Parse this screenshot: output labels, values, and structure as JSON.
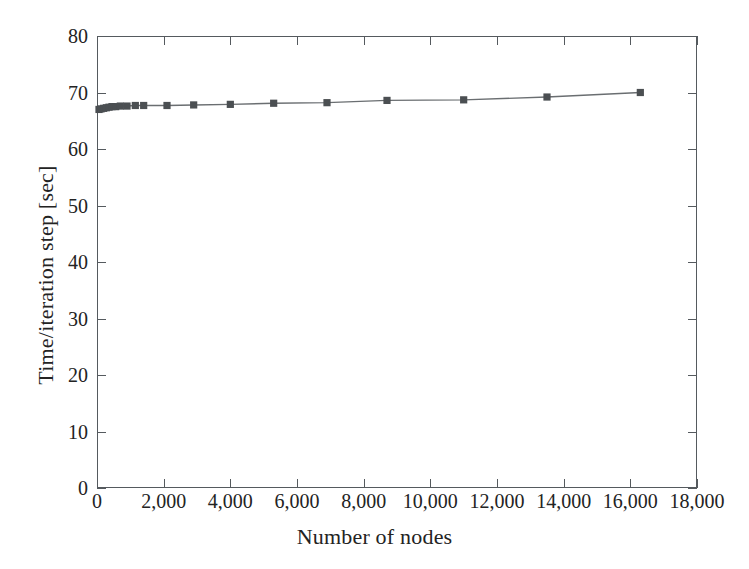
{
  "chart_data": {
    "type": "line",
    "title": "",
    "xlabel": "Number of nodes",
    "ylabel": "Time/iteration step [sec]",
    "xlim": [
      0,
      18000
    ],
    "ylim": [
      0,
      80
    ],
    "grid": false,
    "legend": "none",
    "marker": "square",
    "series_color": "#4b4f52",
    "line_color": "#6a6e71",
    "xticks": [
      0,
      2000,
      4000,
      6000,
      8000,
      10000,
      12000,
      14000,
      16000,
      18000
    ],
    "xtick_labels": [
      "0",
      "2,000",
      "4,000",
      "6,000",
      "8,000",
      "10,000",
      "12,000",
      "14,000",
      "16,000",
      "18,000"
    ],
    "yticks": [
      0,
      10,
      20,
      30,
      40,
      50,
      60,
      70,
      80
    ],
    "ytick_labels": [
      "0",
      "10",
      "20",
      "30",
      "40",
      "50",
      "60",
      "70",
      "80"
    ],
    "series": [
      {
        "name": "Time per iteration step",
        "x": [
          60,
          120,
          200,
          280,
          360,
          450,
          560,
          700,
          900,
          1150,
          1400,
          2100,
          2900,
          4000,
          5300,
          6900,
          8700,
          11000,
          13500,
          16300
        ],
        "y": [
          67.0,
          67.1,
          67.2,
          67.3,
          67.4,
          67.5,
          67.5,
          67.6,
          67.6,
          67.7,
          67.7,
          67.7,
          67.8,
          67.9,
          68.1,
          68.2,
          68.6,
          68.7,
          69.2,
          70.0
        ]
      }
    ]
  },
  "figure": {
    "background_color": "#ffffff",
    "frame_color": "#555a5e",
    "text_color": "#232323"
  }
}
